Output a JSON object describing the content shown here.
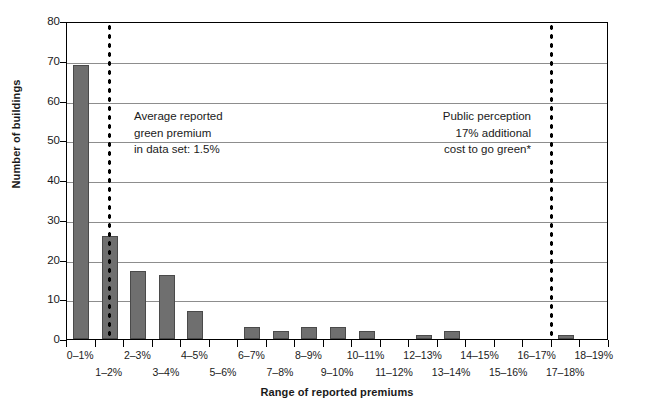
{
  "chart_data": {
    "type": "bar",
    "title": "",
    "xlabel": "Range of reported premiums",
    "ylabel": "Number of buildings",
    "ylim": [
      0,
      80
    ],
    "yticks": [
      0,
      10,
      20,
      30,
      40,
      50,
      60,
      70,
      80
    ],
    "grid": true,
    "legend_position": "none",
    "bar_color": "#6f6f6f",
    "categories": [
      "0–1%",
      "1–2%",
      "2–3%",
      "3–4%",
      "4–5%",
      "5–6%",
      "6–7%",
      "7–8%",
      "8–9%",
      "9–10%",
      "10–11%",
      "11–12%",
      "12–13%",
      "13–14%",
      "14–15%",
      "15–16%",
      "16–17%",
      "17–18%",
      "18–19%"
    ],
    "values": [
      69,
      26,
      17,
      16,
      7,
      0,
      3,
      2,
      3,
      3,
      2,
      0,
      1,
      2,
      0,
      0,
      0,
      1,
      0
    ],
    "annotations": [
      {
        "name": "average-reported-premium",
        "lines": [
          "Average reported",
          "green premium",
          "in data set: 1.5%"
        ],
        "reference_value": 1.5,
        "reference_color": "#000000"
      },
      {
        "name": "public-perception",
        "lines": [
          "Public perception",
          "17% additional",
          "cost to go green*"
        ],
        "reference_value": 17,
        "reference_color": "#000000"
      }
    ]
  },
  "axes": {
    "y_title": "Number of buildings",
    "x_title": "Range of reported premiums",
    "y_tick_labels": [
      "80",
      "70",
      "60",
      "50",
      "40",
      "30",
      "20",
      "10",
      "0"
    ],
    "x_tick_labels_top": [
      "0–1%",
      "2–3%",
      "4–5%",
      "6–7%",
      "8–9%",
      "10–11%",
      "12–13%",
      "14–15%",
      "16–17%",
      "18–19%"
    ],
    "x_tick_labels_bottom": [
      "1–2%",
      "3–4%",
      "5–6%",
      "7–8%",
      "9–10%",
      "11–12%",
      "13–14%",
      "15–16%",
      "17–18%"
    ]
  },
  "annotation_average": {
    "line1": "Average reported",
    "line2": "green premium",
    "line3": "in data set: 1.5%"
  },
  "annotation_perception": {
    "line1": "Public perception",
    "line2": "17% additional",
    "line3": "cost to go green*"
  }
}
